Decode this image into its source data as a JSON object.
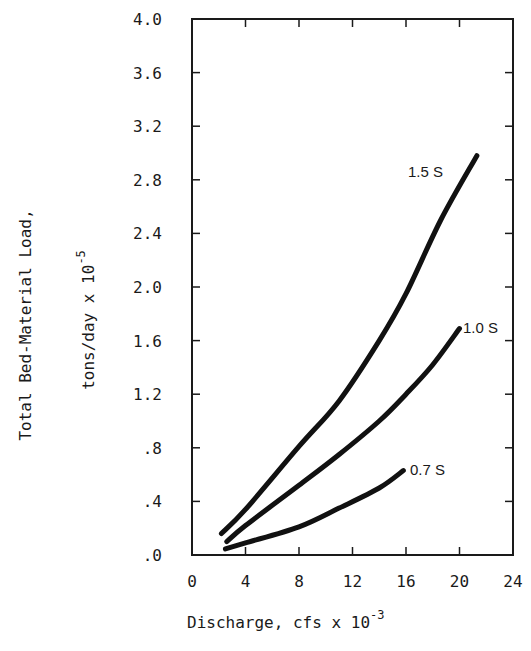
{
  "chart_data": {
    "type": "line",
    "title": "",
    "xlabel": "Discharge, cfs x 10",
    "xlabel_exponent": "-3",
    "ylabel_line1": "Total Bed-Material Load,",
    "ylabel_line2": "tons/day x 10",
    "ylabel_exponent": "-5",
    "xlim": [
      0,
      24
    ],
    "ylim": [
      0,
      4.0
    ],
    "x_ticks": [
      0,
      4,
      8,
      12,
      16,
      20,
      24
    ],
    "x_tick_labels": [
      "0",
      "4",
      "8",
      "12",
      "16",
      "20",
      "24"
    ],
    "y_ticks": [
      0,
      0.4,
      0.8,
      1.2,
      1.6,
      2.0,
      2.4,
      2.8,
      3.2,
      3.6,
      4.0
    ],
    "y_tick_labels": [
      ".0",
      ".4",
      ".8",
      "1.2",
      "1.6",
      "2.0",
      "2.4",
      "2.8",
      "3.2",
      "3.6",
      "4.0"
    ],
    "grid": false,
    "legend_position": "inline labels at curve ends",
    "series": [
      {
        "name": "1.5 S",
        "x": [
          2.2,
          4,
          8,
          11,
          14,
          16,
          18.6,
          21.3
        ],
        "y": [
          0.16,
          0.34,
          0.81,
          1.15,
          1.6,
          1.95,
          2.5,
          2.98
        ]
      },
      {
        "name": "1.0 S",
        "x": [
          2.6,
          4,
          8,
          11,
          14,
          16,
          18,
          20
        ],
        "y": [
          0.1,
          0.22,
          0.52,
          0.75,
          1.0,
          1.2,
          1.42,
          1.69
        ]
      },
      {
        "name": "0.7 S",
        "x": [
          2.5,
          4,
          8,
          11,
          14,
          15.8
        ],
        "y": [
          0.045,
          0.09,
          0.21,
          0.35,
          0.5,
          0.63
        ]
      }
    ]
  },
  "plot_area": {
    "left": 192,
    "top": 19,
    "right": 513,
    "bottom": 555
  },
  "series_labels": [
    {
      "text": "1.5 S",
      "x": 408,
      "y": 177
    },
    {
      "text": "1.0 S",
      "x": 463,
      "y": 333
    },
    {
      "text": "0.7 S",
      "x": 410,
      "y": 475
    }
  ]
}
